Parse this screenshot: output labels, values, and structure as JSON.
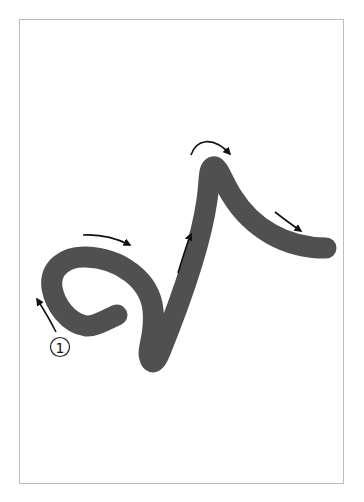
{
  "diagram": {
    "type": "stroke-order",
    "stroke_color": "#505050",
    "arrow_color": "#111111",
    "frame_color": "#bdbdbd",
    "start_marker": {
      "label": "①",
      "number": 1
    },
    "arrows": [
      {
        "id": "arrow-start-up",
        "direction": "up-left"
      },
      {
        "id": "arrow-loop-top",
        "direction": "right"
      },
      {
        "id": "arrow-rise",
        "direction": "up"
      },
      {
        "id": "arrow-apex",
        "direction": "over-right"
      },
      {
        "id": "arrow-descend",
        "direction": "down-right"
      }
    ]
  }
}
